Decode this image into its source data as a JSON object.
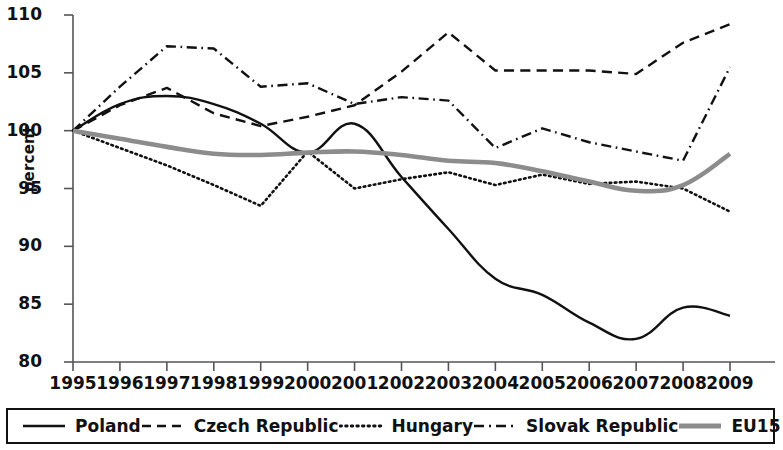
{
  "chart_data": {
    "type": "line",
    "title": "",
    "xlabel": "",
    "ylabel": "percent",
    "x": [
      1995,
      1996,
      1997,
      1998,
      1999,
      2000,
      2001,
      2002,
      2003,
      2004,
      2005,
      2006,
      2007,
      2008,
      2009
    ],
    "categories": [
      "1995",
      "1996",
      "1997",
      "1998",
      "1999",
      "2000",
      "2001",
      "2002",
      "2003",
      "2004",
      "2005",
      "2006",
      "2007",
      "2008",
      "2009"
    ],
    "xlim": [
      1995,
      2009
    ],
    "ylim": [
      80,
      110
    ],
    "yticks": [
      80,
      85,
      90,
      95,
      100,
      105,
      110
    ],
    "grid": false,
    "legend_position": "bottom",
    "series": [
      {
        "name": "Poland",
        "style": "solid",
        "color": "#111111",
        "width": 2.4,
        "values": [
          100.0,
          102.3,
          103.0,
          102.3,
          100.6,
          98.1,
          100.6,
          96.0,
          91.5,
          87.2,
          85.8,
          83.4,
          82.0,
          84.7,
          84.0
        ]
      },
      {
        "name": "Czech Republic",
        "style": "dashed",
        "color": "#111111",
        "width": 2.4,
        "values": [
          100.0,
          102.2,
          103.7,
          101.5,
          100.4,
          101.2,
          102.2,
          105.1,
          108.5,
          105.2,
          105.2,
          105.2,
          104.9,
          107.6,
          109.2
        ]
      },
      {
        "name": "Hungary",
        "style": "dotted",
        "color": "#111111",
        "width": 2.6,
        "values": [
          100.0,
          98.5,
          97.0,
          95.3,
          93.5,
          98.2,
          95.0,
          95.8,
          96.4,
          95.3,
          96.2,
          95.4,
          95.6,
          95.0,
          93.0
        ]
      },
      {
        "name": "Slovak Republic",
        "style": "dashdot",
        "color": "#111111",
        "width": 2.4,
        "values": [
          100.0,
          103.8,
          107.3,
          107.1,
          103.8,
          104.1,
          102.3,
          102.9,
          102.6,
          98.5,
          100.2,
          99.0,
          98.2,
          97.4,
          105.5
        ]
      },
      {
        "name": "EU15",
        "style": "solid",
        "color": "#8c8c8c",
        "width": 4.6,
        "values": [
          100.0,
          99.3,
          98.6,
          98.0,
          97.9,
          98.1,
          98.2,
          97.9,
          97.4,
          97.2,
          96.5,
          95.6,
          94.8,
          95.3,
          98.0
        ]
      }
    ]
  },
  "legend": {
    "items": [
      {
        "label": "Poland",
        "style": "solid",
        "color": "#111111"
      },
      {
        "label": "Czech Republic",
        "style": "dashed",
        "color": "#111111"
      },
      {
        "label": "Hungary",
        "style": "dotted",
        "color": "#111111"
      },
      {
        "label": "Slovak Republic",
        "style": "dashdot",
        "color": "#111111"
      },
      {
        "label": "EU15",
        "style": "solid-thick",
        "color": "#8c8c8c"
      }
    ]
  }
}
